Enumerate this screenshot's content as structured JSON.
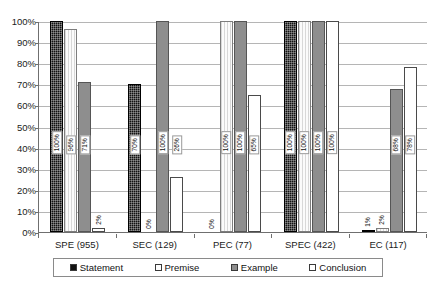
{
  "chart_data": {
    "type": "bar",
    "title": "",
    "xlabel": "",
    "ylabel": "",
    "ylim": [
      0,
      100
    ],
    "ytick_labels": [
      "100%",
      "90%",
      "80%",
      "70%",
      "60%",
      "50%",
      "40%",
      "30%",
      "20%",
      "10%",
      "0%"
    ],
    "ytick_values": [
      100,
      90,
      80,
      70,
      60,
      50,
      40,
      30,
      20,
      10,
      0
    ],
    "grid": true,
    "legend_position": "bottom",
    "categories": [
      "SPE (955)",
      "SEC (129)",
      "PEC (77)",
      "SPEC (422)",
      "EC (117)"
    ],
    "series": [
      {
        "name": "Statement",
        "color": "#121212",
        "values": [
          100,
          70,
          0,
          100,
          1
        ],
        "labels": [
          "100%",
          "70%",
          "0%",
          "100%",
          "1%"
        ]
      },
      {
        "name": "Premise",
        "color": "#fdfdfd",
        "values": [
          96,
          0,
          100,
          100,
          2
        ],
        "labels": [
          "96%",
          "0%",
          "100%",
          "100%",
          "2%"
        ]
      },
      {
        "name": "Example",
        "color": "#8e8e8e",
        "values": [
          71,
          100,
          100,
          100,
          68
        ],
        "labels": [
          "71%",
          "100%",
          "100%",
          "100%",
          "68%"
        ]
      },
      {
        "name": "Conclusion",
        "color": "#ffffff",
        "values": [
          2,
          26,
          65,
          100,
          78
        ],
        "labels": [
          "2%",
          "26%",
          "65%",
          "100%",
          "78%"
        ]
      }
    ]
  },
  "legend": {
    "items": [
      {
        "label": "Statement"
      },
      {
        "label": "Premise"
      },
      {
        "label": "Example"
      },
      {
        "label": "Conclusion"
      }
    ]
  }
}
